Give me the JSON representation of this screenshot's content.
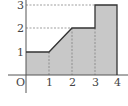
{
  "diagram": {
    "type": "piecewise-function-area",
    "origin_label": "O",
    "x_ticks": [
      "1",
      "2",
      "3",
      "4"
    ],
    "y_ticks": [
      "1",
      "2",
      "3"
    ],
    "function_points": [
      [
        0,
        1
      ],
      [
        1,
        1
      ],
      [
        2,
        2
      ],
      [
        3,
        2
      ],
      [
        3,
        3
      ],
      [
        4,
        3
      ],
      [
        4,
        0
      ]
    ],
    "fill_color": "#c8c8c8",
    "line_color": "#333333"
  }
}
